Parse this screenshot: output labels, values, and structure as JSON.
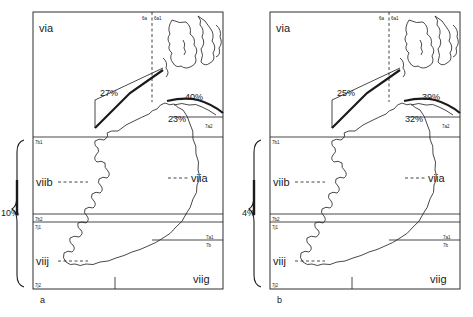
{
  "figure": {
    "type": "two-panel-map"
  },
  "panels": [
    {
      "id": "a",
      "caption": "a",
      "area_labels": {
        "top_left": "via",
        "west_mid": "viib",
        "east_mid": "viia",
        "south_west": "viij",
        "south_east": "viig"
      },
      "boundary_codes": {
        "top_6a": "6a",
        "top_6a1": "6a1",
        "east_7a2": "7a2",
        "left_7b1": "7b1",
        "left_7b2": "7b2",
        "left_7j1": "7j1",
        "left_7j2": "7j2",
        "right_7a1": "7a1",
        "right_7b": "7b"
      },
      "percentages": {
        "northwest": "27%",
        "northeast": "40%",
        "east": "23%",
        "west_bracket": "10%"
      }
    },
    {
      "id": "b",
      "caption": "b",
      "area_labels": {
        "top_left": "via",
        "west_mid": "viib",
        "east_mid": "viia",
        "south_west": "viij",
        "south_east": "viig"
      },
      "boundary_codes": {
        "top_6a": "6a",
        "top_6a1": "6a1",
        "east_7a2": "7a2",
        "left_7b1": "7b1",
        "left_7b2": "7b2",
        "left_7j1": "7j1",
        "left_7j2": "7j2",
        "right_7a1": "7a1",
        "right_7b": "7b"
      },
      "percentages": {
        "northwest": "25%",
        "northeast": "39%",
        "east": "32%",
        "west_bracket": "4%"
      }
    }
  ],
  "colors": {
    "line": "#1a1a1a",
    "background": "#ffffff"
  }
}
